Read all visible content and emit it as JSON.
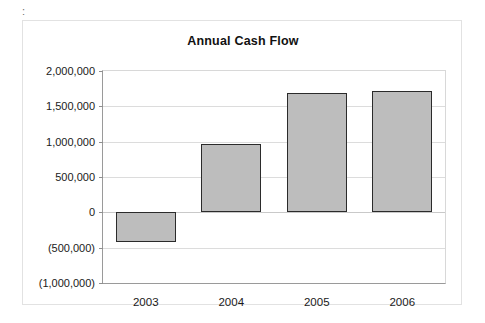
{
  "page": {
    "clipped_top_text": "' '",
    "clipped_marker": ":"
  },
  "chart_data": {
    "type": "bar",
    "title": "Annual Cash Flow",
    "xlabel": "",
    "ylabel": "",
    "categories": [
      "2003",
      "2004",
      "2005",
      "2006"
    ],
    "values": [
      -420000,
      965000,
      1690000,
      1710000
    ],
    "ylim": [
      -1000000,
      2000000
    ],
    "ytick_values": [
      2000000,
      1500000,
      1000000,
      500000,
      0,
      -500000,
      -1000000
    ],
    "ytick_labels": [
      "2,000,000",
      "1,500,000",
      "1,000,000",
      "500,000",
      "0",
      "(500,000)",
      "(1,000,000)"
    ],
    "grid": true,
    "legend": "none",
    "colors": {
      "bar_fill": "#bdbdbd",
      "bar_border": "#2b2b2b",
      "gridline": "#dcdcdc",
      "axis": "#9a9a9a",
      "frame": "#e2e2e2",
      "text": "#1a1a1a",
      "background": "#ffffff"
    }
  }
}
